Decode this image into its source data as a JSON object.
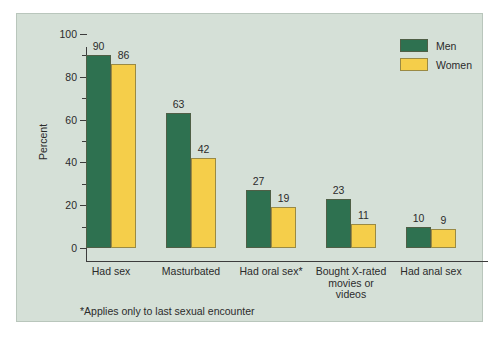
{
  "chart_data": {
    "type": "bar",
    "title": "",
    "subtitle": "",
    "xlabel": "",
    "ylabel": "Percent",
    "ylim": [
      0,
      100
    ],
    "ytick_labels": [
      "100",
      "80",
      "60",
      "40",
      "20",
      "0"
    ],
    "ytick_values": [
      100,
      80,
      60,
      40,
      20,
      0
    ],
    "yminor_values": [
      90,
      70,
      50,
      30,
      10
    ],
    "grid": false,
    "legend_position": "top-right",
    "categories": [
      "Had sex",
      "Masturbated",
      "Had oral sex*",
      "Bought X-rated movies or videos",
      "Had anal sex"
    ],
    "category_lines": [
      [
        "Had sex"
      ],
      [
        "Masturbated"
      ],
      [
        "Had oral sex*"
      ],
      [
        "Bought X-rated",
        "movies or",
        "videos"
      ],
      [
        "Had anal sex"
      ]
    ],
    "series": [
      {
        "name": "Men",
        "color": "#2e7150",
        "values": [
          90,
          63,
          27,
          23,
          10
        ]
      },
      {
        "name": "Women",
        "color": "#f5ce4a",
        "values": [
          86,
          42,
          19,
          11,
          9
        ]
      }
    ],
    "annotations": [
      "*Applies only to last sexual encounter"
    ]
  },
  "legend": {
    "items": [
      {
        "label": "Men",
        "color": "#2e7150"
      },
      {
        "label": "Women",
        "color": "#f5ce4a"
      }
    ]
  },
  "footnote": "*Applies only to last sexual encounter",
  "colors": {
    "panel_background": "#d5e0d7",
    "panel_border": "#b9c6bc",
    "page_background": "#ffffff",
    "axis": "#3c3c3c",
    "text": "#2b2b2b",
    "men": "#2e7150",
    "women": "#f5ce4a"
  }
}
